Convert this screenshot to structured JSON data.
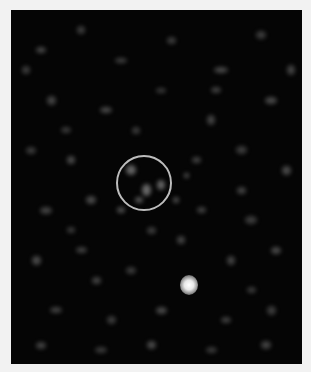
{
  "image": {
    "description": "Astronomical grayscale noise field with a circled target region and a bright point source",
    "background_color": "#050505",
    "border_color": "#f2f2f2"
  },
  "annotations": {
    "target_circle": {
      "cx": 133,
      "cy": 173,
      "r": 28,
      "color": "#bdbdbd"
    },
    "bright_source": {
      "cx": 178,
      "cy": 274,
      "r": 9
    }
  },
  "noise_blobs": [
    [
      30,
      40,
      10,
      6,
      0.5
    ],
    [
      70,
      20,
      8,
      8,
      0.4
    ],
    [
      110,
      50,
      12,
      5,
      0.45
    ],
    [
      160,
      30,
      9,
      7,
      0.4
    ],
    [
      210,
      60,
      14,
      6,
      0.5
    ],
    [
      250,
      25,
      10,
      8,
      0.4
    ],
    [
      40,
      90,
      9,
      9,
      0.45
    ],
    [
      95,
      100,
      12,
      6,
      0.5
    ],
    [
      150,
      80,
      10,
      5,
      0.4
    ],
    [
      200,
      110,
      8,
      10,
      0.45
    ],
    [
      260,
      90,
      12,
      7,
      0.5
    ],
    [
      20,
      140,
      10,
      7,
      0.4
    ],
    [
      60,
      150,
      8,
      8,
      0.5
    ],
    [
      185,
      150,
      9,
      6,
      0.45
    ],
    [
      230,
      140,
      11,
      8,
      0.4
    ],
    [
      275,
      160,
      9,
      9,
      0.5
    ],
    [
      35,
      200,
      12,
      7,
      0.45
    ],
    [
      80,
      190,
      10,
      8,
      0.5
    ],
    [
      190,
      200,
      9,
      6,
      0.45
    ],
    [
      240,
      210,
      12,
      8,
      0.4
    ],
    [
      25,
      250,
      9,
      9,
      0.5
    ],
    [
      70,
      240,
      11,
      6,
      0.45
    ],
    [
      120,
      260,
      10,
      7,
      0.4
    ],
    [
      220,
      250,
      8,
      9,
      0.45
    ],
    [
      265,
      240,
      10,
      7,
      0.5
    ],
    [
      45,
      300,
      12,
      6,
      0.45
    ],
    [
      100,
      310,
      9,
      8,
      0.4
    ],
    [
      150,
      300,
      11,
      7,
      0.5
    ],
    [
      215,
      310,
      10,
      6,
      0.45
    ],
    [
      260,
      300,
      9,
      9,
      0.4
    ],
    [
      30,
      335,
      10,
      7,
      0.45
    ],
    [
      90,
      340,
      12,
      6,
      0.4
    ],
    [
      140,
      335,
      9,
      8,
      0.5
    ],
    [
      200,
      340,
      11,
      6,
      0.4
    ],
    [
      255,
      335,
      10,
      8,
      0.45
    ],
    [
      120,
      160,
      10,
      10,
      0.7
    ],
    [
      135,
      180,
      9,
      12,
      0.75
    ],
    [
      150,
      175,
      8,
      10,
      0.7
    ],
    [
      128,
      190,
      8,
      6,
      0.6
    ],
    [
      165,
      190,
      6,
      6,
      0.55
    ],
    [
      110,
      200,
      8,
      6,
      0.55
    ],
    [
      175,
      165,
      5,
      5,
      0.6
    ],
    [
      55,
      120,
      10,
      6,
      0.4
    ],
    [
      230,
      180,
      9,
      7,
      0.45
    ],
    [
      15,
      60,
      8,
      8,
      0.4
    ],
    [
      280,
      60,
      8,
      10,
      0.45
    ],
    [
      125,
      120,
      8,
      7,
      0.4
    ],
    [
      85,
      270,
      9,
      7,
      0.45
    ],
    [
      240,
      280,
      9,
      6,
      0.4
    ],
    [
      170,
      230,
      8,
      8,
      0.45
    ],
    [
      60,
      220,
      8,
      6,
      0.4
    ],
    [
      205,
      80,
      10,
      6,
      0.45
    ],
    [
      140,
      220,
      9,
      7,
      0.4
    ]
  ]
}
